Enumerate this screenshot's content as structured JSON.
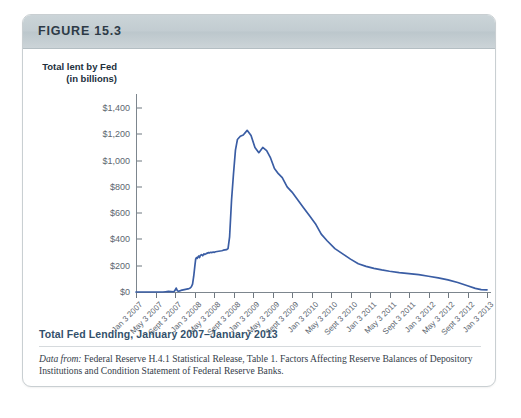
{
  "figure": {
    "number_label": "FIGURE 15.3",
    "caption": "Total Fed Lending, January 2007–January 2013",
    "source_lead": "Data from:",
    "source_text": " Federal Reserve H.4.1 Statistical Release, Table 1. Factors Affecting Reserve Balances of Depository Institutions and Condition Statement of Federal Reserve Banks."
  },
  "colors": {
    "series_line": "#3a5da4",
    "header_bar": "#c5ced2",
    "caption_text": "#33506b",
    "axis": "#7d868e",
    "card_border": "#c9cfd2"
  },
  "chart_data": {
    "type": "line",
    "title": "Total Fed Lending, January 2007–January 2013",
    "xlabel": "",
    "ylabel": "Total lent by Fed (in billions)",
    "ylabel_line1": "Total lent by Fed",
    "ylabel_line2": "(in billions)",
    "ylim": [
      0,
      1400
    ],
    "ytick_values": [
      0,
      200,
      400,
      600,
      800,
      1000,
      1200,
      1400
    ],
    "ytick_labels": [
      "$0",
      "$200",
      "$400",
      "$600",
      "$800",
      "$1,000",
      "$1,200",
      "$1,400"
    ],
    "grid": false,
    "legend": "none",
    "units": "billions of US dollars",
    "xtick_labels": [
      "Jan 3 2007",
      "May 3 2007",
      "Sept 3 2007",
      "Jan 3 2008",
      "May 3 2008",
      "Sept 3 2008",
      "Jan 3 2009",
      "May 3 2009",
      "Sept 3 2009",
      "Jan 3 2010",
      "May 3 2010",
      "Sept 3 2010",
      "Jan 3 2011",
      "May 3 2011",
      "Sept 3 2011",
      "Jan 3 2012",
      "May 3 2012",
      "Sept 3 2012",
      "Jan 3 2013"
    ],
    "series": [
      {
        "name": "Total lent by Fed",
        "color": "#3a5da4",
        "x": [
          0.0,
          0.14,
          0.28,
          0.42,
          0.56,
          0.7,
          0.84,
          0.97,
          1.1,
          1.24,
          1.38,
          1.52,
          1.66,
          1.8,
          1.94,
          2.0,
          2.06,
          2.12,
          2.18,
          2.24,
          2.3,
          2.36,
          2.42,
          2.48,
          2.54,
          2.6,
          2.66,
          2.72,
          2.78,
          2.84,
          2.9,
          2.96,
          3.02,
          3.06,
          3.1,
          3.14,
          3.18,
          3.22,
          3.26,
          3.3,
          3.36,
          3.42,
          3.48,
          3.54,
          3.6,
          3.66,
          3.72,
          3.78,
          3.84,
          3.9,
          3.96,
          4.02,
          4.08,
          4.16,
          4.24,
          4.32,
          4.4,
          4.48,
          4.56,
          4.64,
          4.72,
          4.8,
          4.9,
          5.0,
          5.1,
          5.2,
          5.35,
          5.5,
          5.7,
          5.9,
          6.1,
          6.3,
          6.5,
          6.7,
          6.9,
          7.1,
          7.3,
          7.5,
          7.75,
          8.0,
          8.3,
          8.6,
          8.9,
          9.2,
          9.5,
          9.8,
          10.2,
          10.6,
          11.0,
          11.4,
          11.8,
          12.2,
          12.6,
          13.0,
          13.5,
          14.0,
          14.5,
          15.0,
          15.5,
          16.0,
          16.5,
          17.0,
          17.4,
          17.7,
          18.0
        ],
        "y": [
          0,
          0,
          0,
          0,
          0,
          0,
          0,
          0,
          0,
          0,
          0,
          2,
          4,
          3,
          2,
          12,
          30,
          10,
          6,
          8,
          12,
          14,
          16,
          18,
          20,
          22,
          24,
          26,
          30,
          40,
          60,
          120,
          200,
          250,
          262,
          256,
          268,
          274,
          262,
          278,
          284,
          276,
          290,
          286,
          292,
          296,
          300,
          298,
          302,
          300,
          304,
          302,
          306,
          308,
          310,
          312,
          314,
          318,
          320,
          322,
          330,
          420,
          700,
          900,
          1080,
          1160,
          1185,
          1195,
          1230,
          1190,
          1100,
          1060,
          1100,
          1075,
          1020,
          940,
          900,
          870,
          800,
          760,
          700,
          640,
          580,
          520,
          440,
          390,
          330,
          290,
          250,
          215,
          195,
          180,
          168,
          158,
          148,
          140,
          132,
          120,
          108,
          92,
          72,
          48,
          28,
          18,
          16
        ]
      }
    ],
    "annotations": [
      {
        "label": "peak",
        "value": 1230,
        "approx_date": "Dec 2008"
      },
      {
        "label": "pre-crisis baseline",
        "value": 0,
        "approx_date": "2007"
      },
      {
        "label": "2008 plateau",
        "value": 300,
        "approx_date": "Mar-Aug 2008"
      },
      {
        "label": "final value",
        "value": 16,
        "approx_date": "Jan 3 2013"
      }
    ]
  }
}
